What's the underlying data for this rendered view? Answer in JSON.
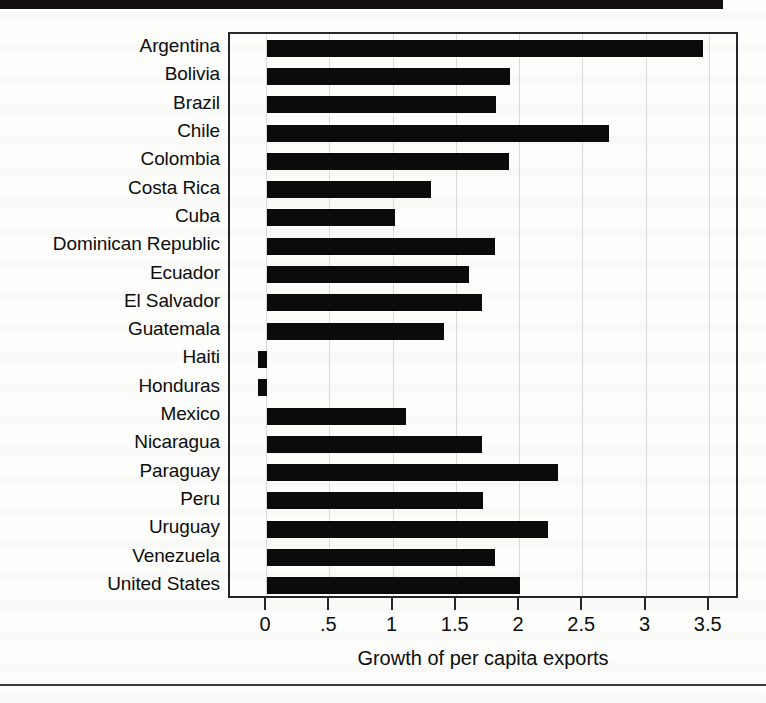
{
  "figure": {
    "xaxis_title": "Growth of per capita exports",
    "tick_labels": [
      "0",
      ".5",
      "1",
      "1.5",
      "2",
      "2.5",
      "3",
      "3.5"
    ],
    "tick_values": [
      0,
      0.5,
      1,
      1.5,
      2,
      2.5,
      3,
      3.5
    ],
    "bar_color": "#0b0b0b",
    "axis_color": "#25252a",
    "grid_color": "#d8d8d4",
    "page_color": "#fdfdfc"
  },
  "chart_data": {
    "type": "bar",
    "orientation": "horizontal",
    "title": "",
    "subtitle": "",
    "xlabel": "Growth of per capita exports",
    "ylabel": "",
    "xlim": [
      -0.1,
      3.7
    ],
    "xticks": [
      0,
      0.5,
      1,
      1.5,
      2,
      2.5,
      3,
      3.5
    ],
    "xticklabels": [
      "0",
      ".5",
      "1",
      "1.5",
      "2",
      "2.5",
      "3",
      "3.5"
    ],
    "grid": true,
    "grid_axis": "x",
    "legend": false,
    "categories": [
      "Argentina",
      "Bolivia",
      "Brazil",
      "Chile",
      "Colombia",
      "Costa Rica",
      "Cuba",
      "Dominican Republic",
      "Ecuador",
      "El Salvador",
      "Guatemala",
      "Haiti",
      "Honduras",
      "Mexico",
      "Nicaragua",
      "Paraguay",
      "Peru",
      "Uruguay",
      "Venezuela",
      "United States"
    ],
    "values": [
      3.45,
      1.92,
      1.81,
      2.7,
      1.91,
      1.3,
      1.01,
      1.8,
      1.6,
      1.7,
      1.4,
      -0.05,
      -0.05,
      1.1,
      1.7,
      2.3,
      1.71,
      2.22,
      1.8,
      2.0
    ]
  }
}
